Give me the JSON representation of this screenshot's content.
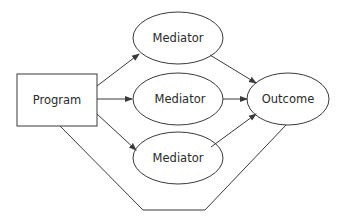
{
  "nodes": {
    "program": {
      "label": "Program",
      "shape": "rectangle"
    },
    "mediator_top": {
      "label": "Mediator",
      "shape": "ellipse"
    },
    "mediator_middle": {
      "label": "Mediator",
      "shape": "ellipse"
    },
    "mediator_bottom": {
      "label": "Mediator",
      "shape": "ellipse"
    },
    "outcome": {
      "label": "Outcome",
      "shape": "ellipse"
    }
  },
  "edges": [
    {
      "from": "Program",
      "to": "Mediator (top)",
      "arrow": true
    },
    {
      "from": "Program",
      "to": "Mediator (middle)",
      "arrow": true
    },
    {
      "from": "Program",
      "to": "Mediator (bottom)",
      "arrow": true
    },
    {
      "from": "Mediator (top)",
      "to": "Outcome",
      "arrow": true
    },
    {
      "from": "Mediator (middle)",
      "to": "Outcome",
      "arrow": true
    },
    {
      "from": "Mediator (bottom)",
      "to": "Outcome",
      "arrow": true
    },
    {
      "from": "Program",
      "to": "Outcome",
      "arrow": false,
      "note": "direct path routed below"
    }
  ],
  "colors": {
    "stroke": "#3a3a3a",
    "text": "#2a2a2a",
    "background": "#ffffff"
  }
}
